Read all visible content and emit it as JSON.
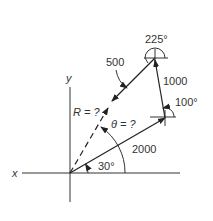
{
  "diagram": {
    "type": "vector-addition",
    "axes": {
      "x_label": "x",
      "y_label": "y"
    },
    "vectors": [
      {
        "magnitude": "2000",
        "angle_label": "30°",
        "angle_deg": 30
      },
      {
        "magnitude": "1000",
        "angle_label": "100°",
        "angle_deg": 100
      },
      {
        "magnitude": "500",
        "angle_label": "225°",
        "angle_deg": 225
      }
    ],
    "resultant": {
      "label": "R = ?",
      "angle_label": "θ = ?"
    },
    "colors": {
      "line": "#333333",
      "background": "#ffffff"
    }
  }
}
